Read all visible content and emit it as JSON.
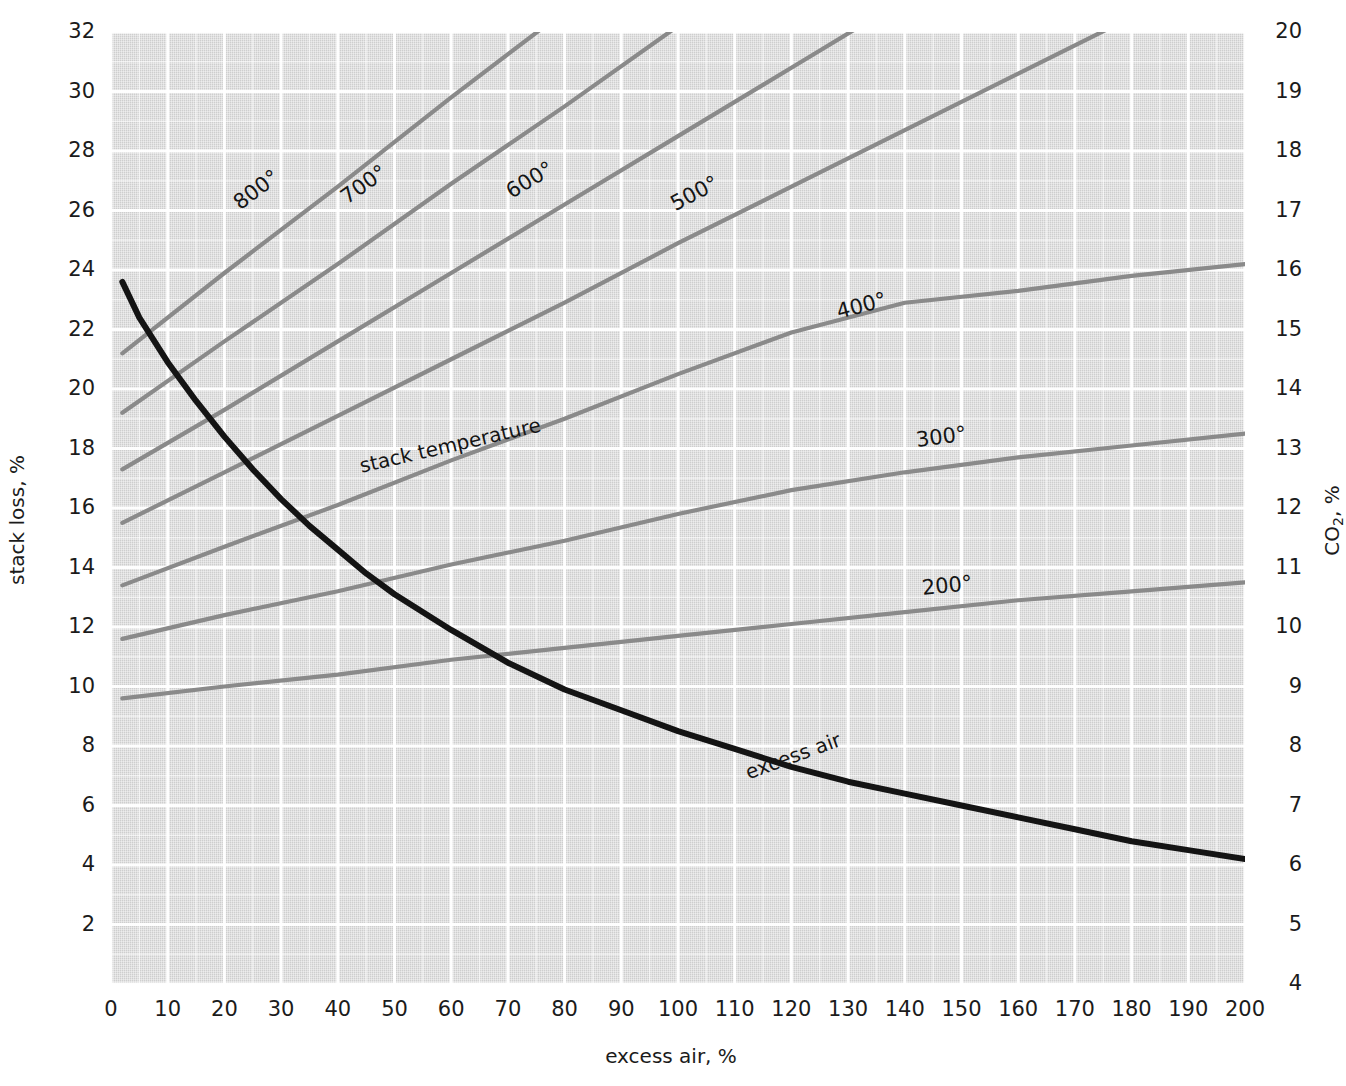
{
  "figure": {
    "background_color": "#ffffff",
    "plot_background_color": "#d6d6d6",
    "gridline_color": "#ffffff",
    "temp_line_color": "#8a8a8a",
    "excess_air_line_color": "#141414"
  },
  "axes": {
    "left": {
      "title": "stack loss, %",
      "ticks": [
        "32",
        "30",
        "28",
        "26",
        "24",
        "22",
        "20",
        "18",
        "16",
        "14",
        "12",
        "10",
        "8",
        "6",
        "4",
        "2"
      ],
      "min": 0,
      "max": 32
    },
    "right": {
      "title_main": "CO",
      "title_sub": "2",
      "title_tail": ", %",
      "title": "CO2, %",
      "ticks": [
        "20",
        "19",
        "18",
        "17",
        "16",
        "15",
        "14",
        "13",
        "12",
        "11",
        "10",
        "9",
        "8",
        "7",
        "6",
        "5",
        "4"
      ],
      "min": 4,
      "max": 20
    },
    "bottom": {
      "title": "excess air, %",
      "ticks": [
        "0",
        "10",
        "20",
        "30",
        "40",
        "50",
        "60",
        "70",
        "80",
        "90",
        "100",
        "110",
        "120",
        "130",
        "140",
        "150",
        "160",
        "170",
        "180",
        "190",
        "200"
      ],
      "min": 0,
      "max": 200
    }
  },
  "annotations": {
    "stack_temperature": "stack temperature",
    "excess_air": "excess air"
  },
  "chart_data": {
    "type": "line",
    "title": "",
    "xlabel": "excess air, %",
    "ylabel": "stack loss, %",
    "ylabel_secondary": "CO2, %",
    "xlim": [
      0,
      200
    ],
    "ylim": [
      0,
      32
    ],
    "ylim_secondary": [
      4,
      20
    ],
    "grid": true,
    "legend": "inline-curve-labels",
    "annotations": [
      {
        "text": "stack temperature",
        "x": 44,
        "y": 17.4,
        "rotation_deg": -13
      },
      {
        "text": "excess air",
        "x": 112,
        "y": 7.1,
        "rotation_deg": -20
      }
    ],
    "series": [
      {
        "name": "800°",
        "label": "800°",
        "axis": "left",
        "label_at": {
          "x": 22,
          "y": 26.2
        },
        "x": [
          2,
          20,
          40,
          60,
          80,
          100,
          120,
          140,
          160,
          180,
          200
        ],
        "y": [
          21.2,
          23.9,
          26.8,
          29.8,
          32.7,
          35.7,
          38.6,
          41.6,
          44.5,
          47.5,
          50.4
        ]
      },
      {
        "name": "700°",
        "label": "700°",
        "axis": "left",
        "label_at": {
          "x": 41,
          "y": 26.4
        },
        "x": [
          2,
          20,
          40,
          60,
          80,
          100,
          120,
          140,
          160,
          180,
          200
        ],
        "y": [
          19.2,
          21.6,
          24.2,
          26.9,
          29.5,
          32.2,
          34.8,
          37.5,
          40.1,
          42.8,
          45.4
        ]
      },
      {
        "name": "600°",
        "label": "600°",
        "axis": "left",
        "label_at": {
          "x": 70,
          "y": 26.6
        },
        "x": [
          2,
          20,
          40,
          60,
          80,
          100,
          120,
          140,
          160,
          180,
          200
        ],
        "y": [
          17.3,
          19.3,
          21.6,
          23.9,
          26.2,
          28.5,
          30.8,
          33.1,
          35.4,
          37.7,
          40.0
        ]
      },
      {
        "name": "500°",
        "label": "500°",
        "axis": "left",
        "label_at": {
          "x": 99,
          "y": 26.2
        },
        "x": [
          2,
          20,
          40,
          60,
          80,
          100,
          120,
          140,
          160,
          180,
          200
        ],
        "y": [
          15.5,
          17.2,
          19.1,
          21.0,
          22.9,
          24.9,
          26.8,
          28.7,
          30.6,
          32.5,
          34.4
        ]
      },
      {
        "name": "400°",
        "label": "400°",
        "axis": "left",
        "label_at": {
          "x": 128,
          "y": 22.6
        },
        "x": [
          2,
          20,
          40,
          60,
          80,
          100,
          120,
          140,
          160,
          180,
          200
        ],
        "y": [
          13.4,
          14.7,
          16.1,
          17.6,
          19.0,
          20.5,
          21.9,
          22.9,
          23.3,
          23.8,
          24.2
        ]
      },
      {
        "name": "300°",
        "label": "300°",
        "axis": "left",
        "label_at": {
          "x": 142,
          "y": 18.3
        },
        "x": [
          2,
          20,
          40,
          60,
          80,
          100,
          120,
          140,
          160,
          180,
          200
        ],
        "y": [
          11.6,
          12.4,
          13.2,
          14.1,
          14.9,
          15.8,
          16.6,
          17.2,
          17.7,
          18.1,
          18.5
        ]
      },
      {
        "name": "200°",
        "label": "200°",
        "axis": "left",
        "label_at": {
          "x": 143,
          "y": 13.3
        },
        "x": [
          2,
          20,
          40,
          60,
          80,
          100,
          120,
          140,
          160,
          180,
          200
        ],
        "y": [
          9.6,
          10.0,
          10.4,
          10.9,
          11.3,
          11.7,
          12.1,
          12.5,
          12.9,
          13.2,
          13.5
        ]
      },
      {
        "name": "excess air",
        "label": "excess air",
        "axis": "right",
        "emphasis": true,
        "x": [
          2,
          5,
          10,
          15,
          20,
          25,
          30,
          35,
          40,
          45,
          50,
          60,
          70,
          80,
          90,
          100,
          110,
          120,
          130,
          140,
          150,
          160,
          170,
          180,
          190,
          200
        ],
        "y": [
          23.6,
          22.4,
          20.9,
          19.6,
          18.4,
          17.3,
          16.3,
          15.4,
          14.6,
          13.8,
          13.1,
          11.9,
          10.8,
          9.9,
          9.2,
          8.5,
          7.9,
          7.3,
          6.8,
          6.4,
          6.0,
          5.6,
          5.2,
          4.8,
          4.5,
          4.2
        ],
        "y_co2": [
          19.3,
          18.6,
          17.7,
          16.9,
          16.2,
          15.5,
          14.9,
          14.3,
          13.8,
          13.3,
          12.8,
          12.0,
          11.3,
          10.7,
          10.2,
          9.7,
          9.3,
          8.9,
          8.6,
          8.3,
          8.0,
          7.7,
          7.4,
          7.2,
          7.0,
          6.8
        ]
      }
    ]
  }
}
